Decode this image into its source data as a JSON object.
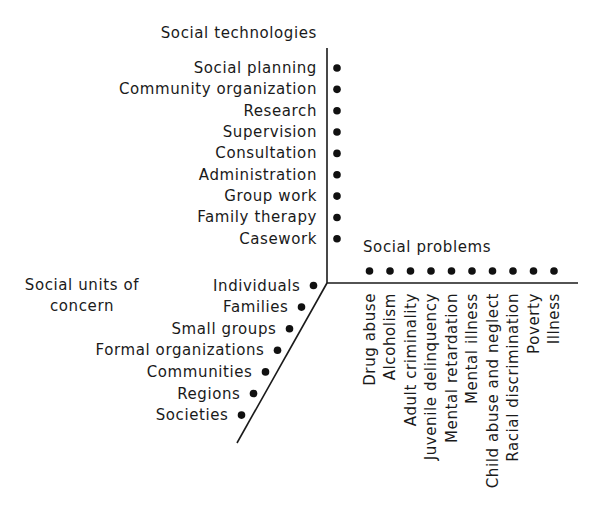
{
  "figure": {
    "type": "three-dimensional classification diagram",
    "axes": [
      {
        "id": "technologies",
        "title": "Social technologies",
        "direction": "up",
        "items": [
          "Social planning",
          "Community organization",
          "Research",
          "Supervision",
          "Consultation",
          "Administration",
          "Group work",
          "Family therapy",
          "Casework"
        ]
      },
      {
        "id": "problems",
        "title": "Social problems",
        "direction": "right",
        "items": [
          "Drug abuse",
          "Alcoholism",
          "Adult criminality",
          "Juvenile delinquency",
          "Mental retardation",
          "Mental illness",
          "Child abuse and neglect",
          "Racial discrimination",
          "Poverty",
          "Illness"
        ]
      },
      {
        "id": "units",
        "title_lines": [
          "Social units of",
          "concern"
        ],
        "direction": "down-left",
        "items": [
          "Individuals",
          "Families",
          "Small groups",
          "Formal organizations",
          "Communities",
          "Regions",
          "Societies"
        ]
      }
    ]
  }
}
